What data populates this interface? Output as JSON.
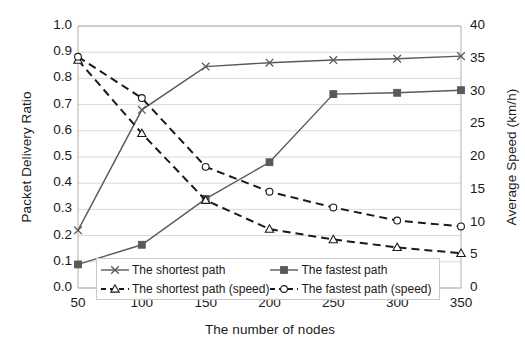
{
  "chart_data": {
    "type": "line",
    "title": "",
    "xlabel": "The number of nodes",
    "ylabel": "Packet Delivery Ratio",
    "y2label": "Average Speed (km/h)",
    "categories": [
      50,
      100,
      150,
      200,
      250,
      300,
      350
    ],
    "x": [
      50,
      100,
      150,
      200,
      250,
      300,
      350
    ],
    "xlim": [
      50,
      350
    ],
    "ylim": [
      0.0,
      1.0
    ],
    "y2lim": [
      0,
      40
    ],
    "xticks": [
      "50",
      "100",
      "150",
      "200",
      "250",
      "300",
      "350"
    ],
    "yticks": [
      "0.0",
      "0.1",
      "0.2",
      "0.3",
      "0.4",
      "0.5",
      "0.6",
      "0.7",
      "0.8",
      "0.9",
      "1.0"
    ],
    "y2ticks": [
      "0",
      "5",
      "10",
      "15",
      "20",
      "25",
      "30",
      "35",
      "40"
    ],
    "grid": "horizontal",
    "legend_position": "inside-bottom",
    "series": [
      {
        "name": "The shortest path",
        "axis": "left",
        "marker": "x",
        "linestyle": "solid",
        "color": "#595959",
        "values": [
          0.22,
          0.68,
          0.845,
          0.86,
          0.87,
          0.875,
          0.885
        ]
      },
      {
        "name": "The fastest path",
        "axis": "left",
        "marker": "square",
        "linestyle": "solid",
        "color": "#595959",
        "values": [
          0.09,
          0.165,
          0.34,
          0.48,
          0.74,
          0.745,
          0.755
        ]
      },
      {
        "name": "The shortest path (speed)",
        "axis": "right",
        "marker": "triangle",
        "linestyle": "dashed",
        "color": "#1a1a1a",
        "values": [
          34.8,
          23.6,
          13.4,
          9.0,
          7.4,
          6.2,
          5.3
        ]
      },
      {
        "name": "The fastest path (speed)",
        "axis": "right",
        "marker": "circle",
        "linestyle": "dashed",
        "color": "#1a1a1a",
        "values": [
          35.3,
          29.0,
          18.5,
          14.7,
          12.3,
          10.3,
          9.4
        ]
      }
    ]
  },
  "legend": {
    "items": [
      {
        "label": "The shortest path"
      },
      {
        "label": "The fastest path"
      },
      {
        "label": "The shortest path (speed)"
      },
      {
        "label": "The fastest path (speed)"
      }
    ]
  }
}
